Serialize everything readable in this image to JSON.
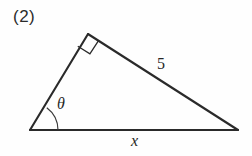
{
  "figure": {
    "problem_number": "(2)",
    "shape": "right-triangle",
    "stroke_color": "#2a2a2a",
    "background_color": "#fefefe",
    "vertices": {
      "left": [
        30,
        130
      ],
      "apex": [
        88,
        34
      ],
      "right": [
        238,
        130
      ]
    },
    "labels": {
      "angle": "θ",
      "hypotenuse": "5",
      "base": "x"
    },
    "markers": {
      "right_angle_vertex": "apex",
      "angle_arc_vertex": "left"
    }
  }
}
